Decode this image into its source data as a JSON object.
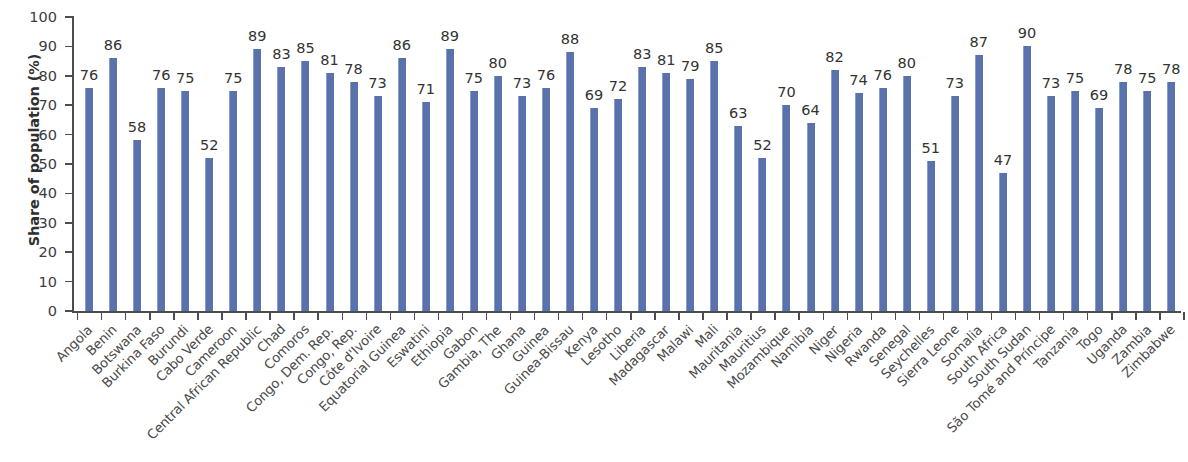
{
  "chart_data": {
    "type": "bar",
    "title": "",
    "subtitle": "",
    "xlabel": "",
    "ylabel": "Share of population (%)",
    "ylim": [
      0,
      100
    ],
    "ytick_step": 10,
    "yticks": [
      "100",
      "90",
      "80",
      "70",
      "60",
      "50",
      "40",
      "30",
      "20",
      "10",
      "0"
    ],
    "grid": false,
    "legend": null,
    "bar_color": "#5972ab",
    "value_labels": true,
    "categories": [
      "Angola",
      "Benin",
      "Botswana",
      "Burkina Faso",
      "Burundi",
      "Cabo Verde",
      "Cameroon",
      "Central African Republic",
      "Chad",
      "Comoros",
      "Congo, Dem. Rep.",
      "Congo, Rep.",
      "Côte d'Ivoire",
      "Equatorial Guinea",
      "Eswatini",
      "Ethiopia",
      "Gabon",
      "Gambia, The",
      "Ghana",
      "Guinea",
      "Guinea-Bissau",
      "Kenya",
      "Lesotho",
      "Liberia",
      "Madagascar",
      "Malawi",
      "Mali",
      "Mauritania",
      "Mauritius",
      "Mozambique",
      "Namibia",
      "Niger",
      "Nigeria",
      "Rwanda",
      "Senegal",
      "Seychelles",
      "Sierra Leone",
      "Somalia",
      "South Africa",
      "South Sudan",
      "São Tomé and Príncipe",
      "Tanzania",
      "Togo",
      "Uganda",
      "Zambia",
      "Zimbabwe"
    ],
    "values": [
      76,
      86,
      58,
      76,
      75,
      52,
      75,
      89,
      83,
      85,
      81,
      78,
      73,
      86,
      71,
      89,
      75,
      80,
      73,
      76,
      88,
      69,
      72,
      83,
      81,
      79,
      85,
      63,
      52,
      70,
      64,
      82,
      74,
      76,
      80,
      51,
      73,
      87,
      47,
      90,
      73,
      75,
      69,
      78,
      75,
      78
    ]
  }
}
